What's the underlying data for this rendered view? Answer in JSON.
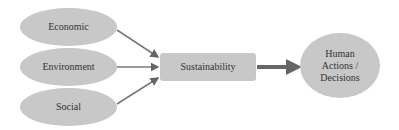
{
  "diagram": {
    "nodes": {
      "economic": {
        "label": "Economic"
      },
      "environment": {
        "label": "Environment"
      },
      "social": {
        "label": "Social"
      },
      "sustainability": {
        "label": "Sustainability"
      },
      "human": {
        "label": "Human Actions / Decisions"
      }
    },
    "edges": [
      {
        "from": "Economic",
        "to": "Sustainability"
      },
      {
        "from": "Environment",
        "to": "Sustainability"
      },
      {
        "from": "Social",
        "to": "Sustainability"
      },
      {
        "from": "Sustainability",
        "to": "Human Actions / Decisions"
      }
    ],
    "colors": {
      "node_fill": "#c8c8c8",
      "arrow": "#666666",
      "text": "#333333"
    }
  }
}
